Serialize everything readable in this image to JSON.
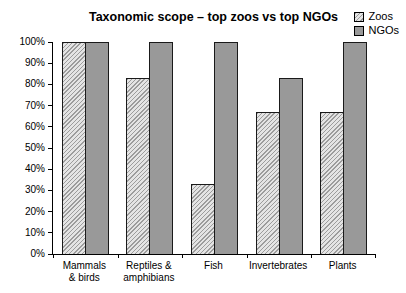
{
  "colors": {
    "ngo_fill": "#999999",
    "zoo_hatch_line": "#9c9c9c",
    "zoo_hatch_bg": "#e4e4e4",
    "bar_border": "#1a1a1a",
    "axis_line": "#000000",
    "text": "#000000"
  },
  "chart_data": {
    "type": "bar",
    "title": "Taxonomic scope – top zoos vs top NGOs",
    "categories": [
      "Mammals & birds",
      "Reptiles & amphibians",
      "Fish",
      "Invertebrates",
      "Plants"
    ],
    "category_label_lines": [
      [
        "Mammals",
        "& birds"
      ],
      [
        "Reptiles &",
        "amphibians"
      ],
      [
        "Fish"
      ],
      [
        "Invertebrates"
      ],
      [
        "Plants"
      ]
    ],
    "series": [
      {
        "name": "Zoos",
        "style": "hatched",
        "values": [
          100,
          83,
          33,
          67,
          67
        ]
      },
      {
        "name": "NGOs",
        "style": "solid",
        "values": [
          100,
          100,
          100,
          83,
          100
        ]
      }
    ],
    "xlabel": "",
    "ylabel": "",
    "ylim": [
      0,
      100
    ],
    "ytick_step": 10,
    "ytick_suffix": "%",
    "grid": false,
    "legend_position": "top-right"
  }
}
